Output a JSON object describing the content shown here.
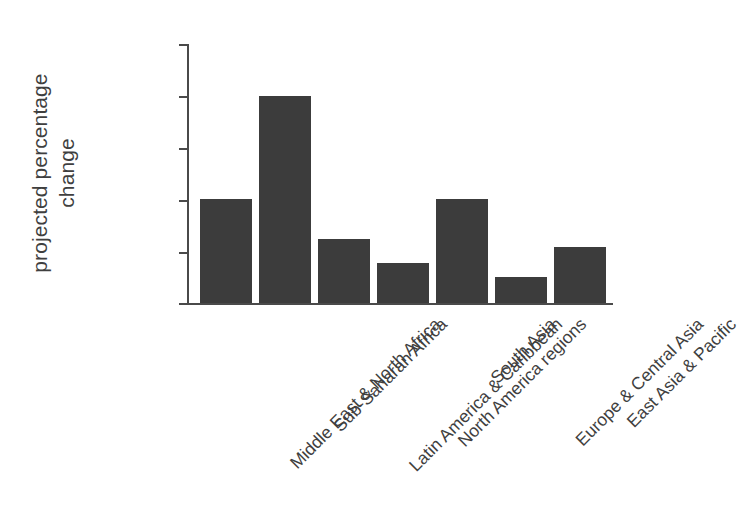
{
  "chart_data": {
    "type": "bar",
    "title": "",
    "xlabel": "",
    "ylabel": "projected percentage\nchange",
    "ylim": [
      0,
      250
    ],
    "yticks": [
      0,
      50,
      100,
      150,
      200,
      250
    ],
    "grid": false,
    "legend": null,
    "bar_color": "#3c3c3c",
    "axis_color": "#4a4a4a",
    "background_color": "#ffffff",
    "label_rotation_deg": -45,
    "categories": [
      "Middle East & North Africa",
      "Sub-Saharan Africa",
      "Latin America & Caribbean",
      "North America regions",
      "South Asia",
      "Europe & Central Asia",
      "East Asia & Pacific"
    ],
    "values": [
      100,
      200,
      62,
      39,
      100,
      25,
      54
    ],
    "series": [
      {
        "name": "projected percentage change",
        "values": [
          100,
          200,
          62,
          39,
          100,
          25,
          54
        ]
      }
    ]
  },
  "axis": {
    "y_title_line1": "projected percentage",
    "y_title_line2": "change",
    "y_tick_labels": [
      "250",
      "200",
      "150",
      "100",
      "50",
      "0"
    ]
  }
}
